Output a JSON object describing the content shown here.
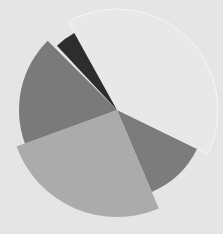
{
  "chart_data": {
    "type": "pie",
    "variant": "polar-area (variable radius sectors)",
    "title": "",
    "legend": [],
    "center": [
      117,
      110
    ],
    "background": "#e5e5e5",
    "sectors": [
      {
        "start_deg": 26,
        "end_deg": 67,
        "radius": 89,
        "color": "#7c7c7c"
      },
      {
        "start_deg": 67,
        "end_deg": 160,
        "radius": 107,
        "color": "#ababab"
      },
      {
        "start_deg": 160,
        "end_deg": 225,
        "radius": 98,
        "color": "#7a7a7a"
      },
      {
        "start_deg": 227,
        "end_deg": 241,
        "radius": 88,
        "color": "#2d2d2d"
      },
      {
        "start_deg": 241,
        "end_deg": 386,
        "radius": 101,
        "color": "#e8e8e8",
        "stroke": "#f6f6f6"
      }
    ],
    "values": [
      41,
      93,
      65,
      14,
      145
    ]
  }
}
